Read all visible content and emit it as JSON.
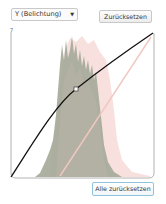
{
  "channel_select": {
    "selected": "Y (Belichtung)",
    "icon": "chevron-down-icon",
    "chevron_glyph": "▼"
  },
  "buttons": {
    "reset": "Zurücksetzen",
    "reset_all": "Alle zurücksetzen"
  },
  "curve_editor": {
    "corner_tick": "7",
    "curve_color": "#111111",
    "reference_line_color": "#f0c8c0",
    "histogram_color": "#9aa090",
    "histogram_overlay_color": "#f2c9c4",
    "control_points": [
      {
        "x": 0,
        "y": 0
      },
      {
        "x": 0.45,
        "y": 0.6
      },
      {
        "x": 1,
        "y": 1
      }
    ]
  }
}
